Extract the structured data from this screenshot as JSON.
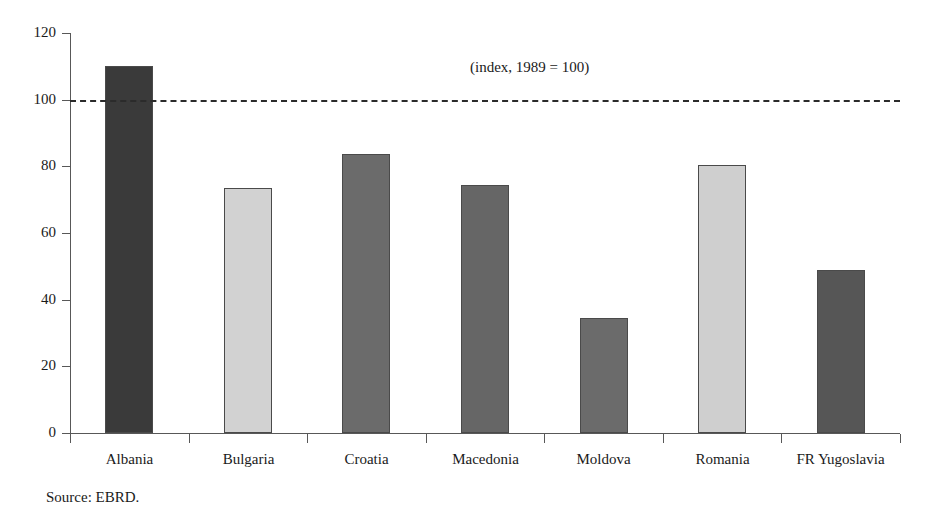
{
  "chart_data": {
    "type": "bar",
    "title": "",
    "subtitle": "",
    "annotation": "(index, 1989 = 100)",
    "source": "Source: EBRD.",
    "xlabel": "",
    "ylabel": "",
    "ylim": [
      0,
      120
    ],
    "ytick_values": [
      0,
      20,
      40,
      60,
      80,
      100,
      120
    ],
    "ytick_labels": [
      "0",
      "20",
      "40",
      "60",
      "80",
      "100",
      "120"
    ],
    "grid": false,
    "legend": "none",
    "reference_line": {
      "value": 100,
      "style": "dashed",
      "label": "1989 = 100"
    },
    "categories": [
      "Albania",
      "Bulgaria",
      "Croatia",
      "Macedonia",
      "Moldova",
      "Romania",
      "FR Yugoslavia"
    ],
    "values": [
      110,
      73.6,
      83.8,
      74.5,
      34.4,
      80.5,
      48.8
    ],
    "bar_colors": [
      "#3a3a3a",
      "#d2d2d2",
      "#6b6b6b",
      "#666666",
      "#6b6b6b",
      "#cfcfcf",
      "#565656"
    ],
    "bar_edge_color": "#4a4a4a",
    "axis_color": "#585858",
    "background_color": "#ffffff"
  },
  "axis": {
    "y_ticks": [
      {
        "label": "120",
        "value": 120
      },
      {
        "label": "100",
        "value": 100
      },
      {
        "label": "80",
        "value": 80
      },
      {
        "label": "60",
        "value": 60
      },
      {
        "label": "40",
        "value": 40
      },
      {
        "label": "20",
        "value": 20
      },
      {
        "label": "0",
        "value": 0
      }
    ]
  },
  "bars": [
    {
      "label": "Albania",
      "value": 110
    },
    {
      "label": "Bulgaria",
      "value": 73.6
    },
    {
      "label": "Croatia",
      "value": 83.8
    },
    {
      "label": "Macedonia",
      "value": 74.5
    },
    {
      "label": "Moldova",
      "value": 34.4
    },
    {
      "label": "Romania",
      "value": 80.5
    },
    {
      "label": "FR Yugoslavia",
      "value": 48.8
    }
  ]
}
